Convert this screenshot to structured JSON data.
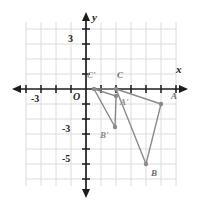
{
  "figure": {
    "type": "coordinate-plane",
    "title": "",
    "axes": {
      "x_label": "x",
      "y_label": "y",
      "origin_label": "O",
      "x_ticks": [
        -3
      ],
      "x_tick_labels": [
        "-3"
      ],
      "y_ticks": [
        3,
        -3,
        -5
      ],
      "y_tick_labels": [
        "3",
        "-3",
        "-5"
      ],
      "xlim": [
        -4.5,
        6.2
      ],
      "ylim": [
        -6.3,
        4.3
      ],
      "grid": true,
      "grid_color": "#d9d9dc",
      "axis_color": "#1c1c1c"
    },
    "shape_color": "#8a8a8a",
    "shapes": [
      {
        "name": "triangle-ABC",
        "vertices": [
          {
            "label": "A",
            "x": 5,
            "y": -1
          },
          {
            "label": "B",
            "x": 4,
            "y": -5
          },
          {
            "label": "C",
            "x": 2,
            "y": 0
          }
        ]
      },
      {
        "name": "triangle-A-prime-B-prime-C-prime",
        "vertices": [
          {
            "label": "A'",
            "x": 2,
            "y": -0.45
          },
          {
            "label": "B'",
            "x": 1.9,
            "y": -2.5
          },
          {
            "label": "C'",
            "x": 0.55,
            "y": 0
          }
        ]
      }
    ],
    "point_labels": [
      {
        "text": "A",
        "px": 172,
        "py": 96
      },
      {
        "text": "B",
        "px": 152,
        "py": 174
      },
      {
        "text": "C",
        "px": 118,
        "py": 74
      },
      {
        "text": "A'",
        "px": 120,
        "py": 100
      },
      {
        "text": "B'",
        "px": 100,
        "py": 134
      },
      {
        "text": "C'",
        "px": 88,
        "py": 74
      }
    ]
  }
}
